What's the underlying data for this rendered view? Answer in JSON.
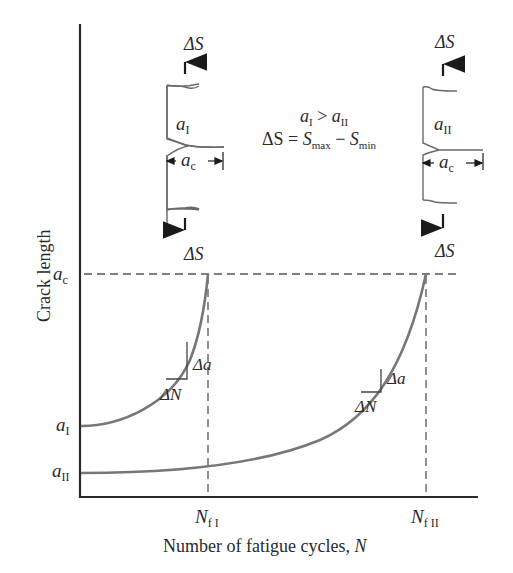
{
  "diagram": {
    "type": "crack-growth-curves",
    "axes": {
      "ylabel": "Crack length",
      "xlabel_prefix": "Number of fatigue cycles, ",
      "xlabel_var": "N",
      "y_ticks": [
        {
          "base": "a",
          "sub": "c",
          "label": "a_c"
        },
        {
          "base": "a",
          "sub": "I",
          "label": "a_I"
        },
        {
          "base": "a",
          "sub": "II",
          "label": "a_II"
        }
      ],
      "x_ticks": [
        {
          "base": "N",
          "sub": "f I",
          "label": "N_fI"
        },
        {
          "base": "N",
          "sub": "f II",
          "label": "N_fII"
        }
      ]
    },
    "relations": {
      "inequality_left": "a",
      "inequality_left_sub": "I",
      "inequality_op": " > ",
      "inequality_right": "a",
      "inequality_right_sub": "II",
      "stress_lhs": "ΔS = ",
      "stress_s1": "S",
      "stress_s1_sub": "max",
      "stress_minus": " − ",
      "stress_s2": "S",
      "stress_s2_sub": "min"
    },
    "specimens": [
      {
        "id": "I",
        "crack_base": "a",
        "crack_sub": "I",
        "critical_base": "a",
        "critical_sub": "c",
        "load_top": "ΔS",
        "load_bottom": "ΔS"
      },
      {
        "id": "II",
        "crack_base": "a",
        "crack_sub": "II",
        "critical_base": "a",
        "critical_sub": "c",
        "load_top": "ΔS",
        "load_bottom": "ΔS"
      }
    ],
    "curves": [
      {
        "name": "curve-I",
        "start": "a_I",
        "end": "a_c at N_fI",
        "slope_label_da": "Δa",
        "slope_label_dN": "ΔN"
      },
      {
        "name": "curve-II",
        "start": "a_II",
        "end": "a_c at N_fII",
        "slope_label_da": "Δa",
        "slope_label_dN": "ΔN"
      }
    ],
    "colors": {
      "axis": "#2b2b2b",
      "curve": "#7a7a7a",
      "dashed": "#555555",
      "text": "#2a2a2a",
      "specimen": "#6a6a6a"
    }
  }
}
